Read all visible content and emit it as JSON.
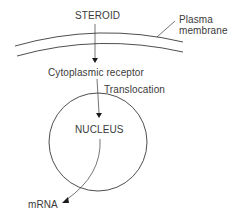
{
  "diagram": {
    "type": "steroid hormone action pathway",
    "labels": {
      "steroid": "STEROID",
      "plasma_membrane_line1": "Plasma",
      "plasma_membrane_line2": "membrane",
      "cytoplasmic_receptor": "Cytoplasmic receptor",
      "translocation": "Translocation",
      "nucleus": "NUCLEUS",
      "mrna": "mRNA"
    },
    "nodes": [
      {
        "id": "steroid",
        "label": "STEROID"
      },
      {
        "id": "plasma-membrane",
        "label": "Plasma membrane"
      },
      {
        "id": "cytoplasmic-receptor",
        "label": "Cytoplasmic receptor"
      },
      {
        "id": "nucleus",
        "label": "NUCLEUS"
      },
      {
        "id": "mrna",
        "label": "mRNA"
      }
    ],
    "edges": [
      {
        "from": "steroid",
        "to": "cytoplasmic-receptor",
        "via": "plasma-membrane"
      },
      {
        "from": "cytoplasmic-receptor",
        "to": "nucleus",
        "label": "Translocation"
      },
      {
        "from": "nucleus",
        "to": "mrna"
      }
    ],
    "colors": {
      "line": "#3a3a3a",
      "text": "#3a3a3a",
      "background": "#ffffff"
    }
  }
}
